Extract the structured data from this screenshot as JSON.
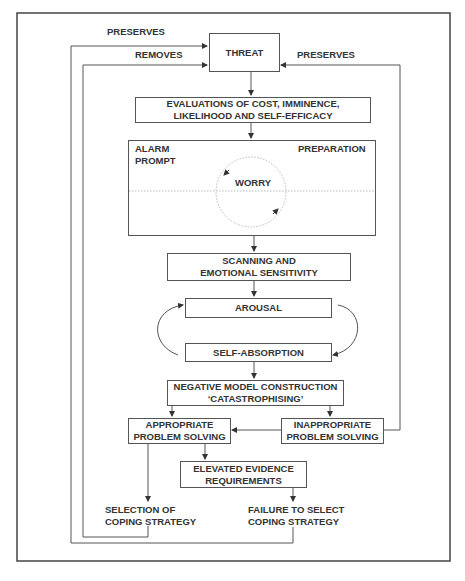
{
  "diagram": {
    "nodes": {
      "threat": "THREAT",
      "evaluations": [
        "EVALUATIONS OF COST, IMMINENCE,",
        "LIKELIHOOD AND SELF-EFFICACY"
      ],
      "alarm": [
        "ALARM",
        "PROMPT"
      ],
      "preparation": "PREPARATION",
      "worry": "WORRY",
      "scanning": [
        "SCANNING AND",
        "EMOTIONAL SENSITIVITY"
      ],
      "arousal": "AROUSAL",
      "self_absorption": "SELF-ABSORPTION",
      "negative_model": [
        "NEGATIVE MODEL CONSTRUCTION",
        "‘CATASTROPHISING’"
      ],
      "appropriate": [
        "APPROPRIATE",
        "PROBLEM SOLVING"
      ],
      "inappropriate": [
        "INAPPROPRIATE",
        "PROBLEM SOLVING"
      ],
      "elevated": [
        "ELEVATED EVIDENCE",
        "REQUIREMENTS"
      ],
      "selection": [
        "SELECTION OF",
        "COPING STRATEGY"
      ],
      "failure": [
        "FAILURE TO SELECT",
        "COPING STRATEGY"
      ]
    },
    "edge_labels": {
      "preserves_left": "PRESERVES",
      "removes": "REMOVES",
      "preserves_right": "PRESERVES"
    },
    "colors": {
      "line": "#555555",
      "text": "#333333",
      "dotted": "#bbbbbb"
    }
  }
}
